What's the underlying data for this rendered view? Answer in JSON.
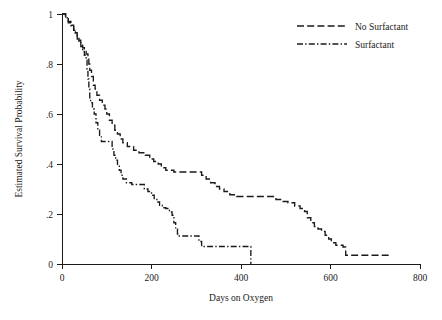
{
  "chart_data": {
    "type": "line",
    "subtype": "kaplan-meier-step",
    "title": "",
    "xlabel": "Days on Oxygen",
    "ylabel": "Estimated Survival Probability",
    "xlim": [
      0,
      800
    ],
    "ylim": [
      0,
      1
    ],
    "xticks": [
      0,
      200,
      400,
      600,
      800
    ],
    "xtick_labels": [
      "0",
      "200",
      "400",
      "600",
      "800"
    ],
    "yticks": [
      0,
      0.2,
      0.4,
      0.6,
      0.8,
      1
    ],
    "ytick_labels": [
      "0",
      ".2",
      ".4",
      ".6",
      ".8",
      "1"
    ],
    "grid": false,
    "legend_position": "top-right",
    "series": [
      {
        "name": "No Surfactant",
        "line_style": "long-dash",
        "color": "#1a1a1a",
        "points": [
          [
            0,
            1.0
          ],
          [
            8,
            0.985
          ],
          [
            14,
            0.97
          ],
          [
            20,
            0.955
          ],
          [
            26,
            0.94
          ],
          [
            30,
            0.925
          ],
          [
            34,
            0.91
          ],
          [
            38,
            0.895
          ],
          [
            42,
            0.88
          ],
          [
            46,
            0.865
          ],
          [
            50,
            0.85
          ],
          [
            54,
            0.84
          ],
          [
            58,
            0.83
          ],
          [
            60,
            0.8
          ],
          [
            62,
            0.775
          ],
          [
            66,
            0.75
          ],
          [
            70,
            0.715
          ],
          [
            74,
            0.7
          ],
          [
            78,
            0.675
          ],
          [
            84,
            0.655
          ],
          [
            90,
            0.635
          ],
          [
            96,
            0.62
          ],
          [
            100,
            0.6
          ],
          [
            106,
            0.575
          ],
          [
            112,
            0.555
          ],
          [
            118,
            0.535
          ],
          [
            124,
            0.52
          ],
          [
            130,
            0.5
          ],
          [
            136,
            0.485
          ],
          [
            146,
            0.47
          ],
          [
            160,
            0.455
          ],
          [
            172,
            0.445
          ],
          [
            186,
            0.435
          ],
          [
            196,
            0.42
          ],
          [
            205,
            0.41
          ],
          [
            215,
            0.4
          ],
          [
            222,
            0.385
          ],
          [
            232,
            0.375
          ],
          [
            250,
            0.368
          ],
          [
            300,
            0.368
          ],
          [
            312,
            0.355
          ],
          [
            322,
            0.34
          ],
          [
            332,
            0.325
          ],
          [
            342,
            0.31
          ],
          [
            352,
            0.3
          ],
          [
            362,
            0.29
          ],
          [
            375,
            0.277
          ],
          [
            390,
            0.27
          ],
          [
            470,
            0.27
          ],
          [
            478,
            0.258
          ],
          [
            492,
            0.25
          ],
          [
            505,
            0.245
          ],
          [
            520,
            0.232
          ],
          [
            532,
            0.222
          ],
          [
            542,
            0.21
          ],
          [
            548,
            0.185
          ],
          [
            556,
            0.165
          ],
          [
            564,
            0.15
          ],
          [
            572,
            0.14
          ],
          [
            580,
            0.13
          ],
          [
            588,
            0.115
          ],
          [
            596,
            0.1
          ],
          [
            602,
            0.085
          ],
          [
            612,
            0.075
          ],
          [
            628,
            0.068
          ],
          [
            634,
            0.035
          ],
          [
            730,
            0.035
          ]
        ]
      },
      {
        "name": "Surfactant",
        "line_style": "dash-dot",
        "color": "#1a1a1a",
        "points": [
          [
            0,
            1.0
          ],
          [
            8,
            0.985
          ],
          [
            14,
            0.965
          ],
          [
            20,
            0.95
          ],
          [
            26,
            0.935
          ],
          [
            30,
            0.92
          ],
          [
            34,
            0.9
          ],
          [
            38,
            0.885
          ],
          [
            42,
            0.87
          ],
          [
            46,
            0.85
          ],
          [
            50,
            0.835
          ],
          [
            54,
            0.815
          ],
          [
            56,
            0.78
          ],
          [
            58,
            0.74
          ],
          [
            60,
            0.7
          ],
          [
            62,
            0.665
          ],
          [
            64,
            0.645
          ],
          [
            68,
            0.62
          ],
          [
            72,
            0.6
          ],
          [
            76,
            0.565
          ],
          [
            80,
            0.535
          ],
          [
            84,
            0.515
          ],
          [
            88,
            0.49
          ],
          [
            108,
            0.49
          ],
          [
            112,
            0.46
          ],
          [
            116,
            0.435
          ],
          [
            120,
            0.415
          ],
          [
            124,
            0.395
          ],
          [
            128,
            0.375
          ],
          [
            132,
            0.355
          ],
          [
            136,
            0.34
          ],
          [
            144,
            0.325
          ],
          [
            156,
            0.318
          ],
          [
            178,
            0.318
          ],
          [
            184,
            0.3
          ],
          [
            192,
            0.29
          ],
          [
            200,
            0.275
          ],
          [
            206,
            0.262
          ],
          [
            212,
            0.248
          ],
          [
            218,
            0.235
          ],
          [
            224,
            0.225
          ],
          [
            232,
            0.222
          ],
          [
            240,
            0.208
          ],
          [
            246,
            0.195
          ],
          [
            250,
            0.165
          ],
          [
            254,
            0.14
          ],
          [
            258,
            0.12
          ],
          [
            262,
            0.112
          ],
          [
            300,
            0.112
          ],
          [
            306,
            0.09
          ],
          [
            312,
            0.07
          ],
          [
            420,
            0.07
          ],
          [
            422,
            0.0
          ]
        ]
      }
    ]
  },
  "axes": {
    "y_title": "Estimated Survival Probability",
    "x_title": "Days on Oxygen",
    "x_tick_labels": [
      "0",
      "200",
      "400",
      "600",
      "800"
    ],
    "y_tick_labels": [
      "1",
      ".8",
      ".6",
      ".4",
      ".2",
      "0"
    ]
  },
  "legend": {
    "entries": [
      {
        "label": "No Surfactant",
        "style": "long-dash"
      },
      {
        "label": "Surfactant",
        "style": "dash-dot"
      }
    ]
  },
  "colors": {
    "ink": "#1a1a1a",
    "background": "#ffffff"
  }
}
